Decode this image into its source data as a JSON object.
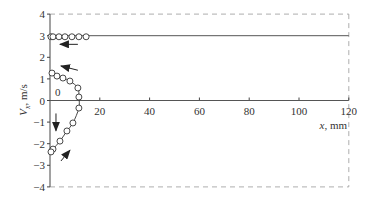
{
  "chart_data": {
    "type": "scatter",
    "title": "",
    "xlabel": "x, mm",
    "ylabel": "V_x, m/s",
    "xlim": [
      0,
      120
    ],
    "ylim": [
      -4,
      4
    ],
    "x_ticks": [
      0,
      20,
      40,
      60,
      80,
      100,
      120
    ],
    "y_ticks": [
      4,
      3,
      2,
      1,
      0,
      -1,
      -2,
      -3,
      -4
    ],
    "annotation_zero_label": "0",
    "grid": false,
    "reference_lines": [
      {
        "name": "upper-velocity-line",
        "value": 3,
        "style": "solid"
      },
      {
        "name": "zero-axis-line",
        "value": 0,
        "style": "solid"
      },
      {
        "name": "upper-bound",
        "value": 4,
        "style": "dashed"
      },
      {
        "name": "lower-bound",
        "value": -4,
        "style": "dashed"
      },
      {
        "name": "right-bound",
        "x": 120,
        "style": "dashed"
      }
    ],
    "series": [
      {
        "name": "top-row",
        "marker": "open-circle",
        "points": [
          [
            0.4,
            2.95
          ],
          [
            1.2,
            2.95
          ],
          [
            3.6,
            2.95
          ],
          [
            6.0,
            2.95
          ],
          [
            8.8,
            2.95
          ],
          [
            11.6,
            2.95
          ],
          [
            14.5,
            2.95
          ]
        ]
      },
      {
        "name": "profile",
        "marker": "open-circle",
        "line": "smooth",
        "points": [
          [
            0.8,
            1.27
          ],
          [
            2.8,
            1.13
          ],
          [
            5.2,
            1.04
          ],
          [
            8.0,
            0.9
          ],
          [
            11.2,
            0.58
          ],
          [
            11.6,
            0.16
          ],
          [
            11.6,
            -0.35
          ],
          [
            9.2,
            -1.04
          ],
          [
            6.8,
            -1.41
          ],
          [
            4.0,
            -1.88
          ],
          [
            1.2,
            -2.25
          ],
          [
            0.4,
            -2.38
          ]
        ]
      }
    ],
    "arrows": [
      {
        "name": "arrow-top-left",
        "from": [
          11.2,
          2.6
        ],
        "to": [
          4.0,
          2.6
        ]
      },
      {
        "name": "arrow-upper-left",
        "from": [
          11.2,
          1.4
        ],
        "to": [
          4.4,
          1.6
        ]
      },
      {
        "name": "arrow-down",
        "from": [
          2.4,
          -0.6
        ],
        "to": [
          2.4,
          -1.4
        ]
      },
      {
        "name": "arrow-lower-up",
        "from": [
          4.4,
          -2.8
        ],
        "to": [
          8.0,
          -2.3
        ]
      }
    ]
  }
}
